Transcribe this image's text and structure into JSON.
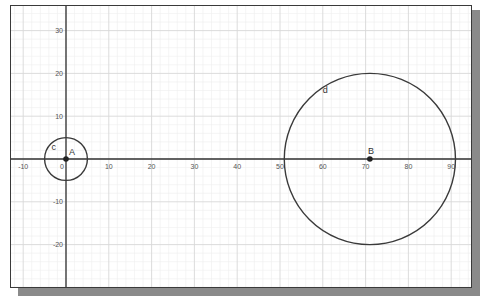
{
  "chart_data": {
    "type": "scatter",
    "title": "",
    "xlabel": "",
    "ylabel": "",
    "xlim": [
      -12,
      94
    ],
    "ylim": [
      -30,
      35
    ],
    "grid": true,
    "x_ticks": [
      -10,
      0,
      10,
      20,
      30,
      40,
      50,
      60,
      70,
      80,
      90
    ],
    "y_ticks": [
      30,
      20,
      10,
      -10,
      -20
    ],
    "x_tick_labels": [
      "-10",
      "0",
      "10",
      "20",
      "30",
      "40",
      "50",
      "60",
      "70",
      "80",
      "90"
    ],
    "y_tick_labels": [
      "30",
      "20",
      "10",
      "-10",
      "-20"
    ],
    "points": [
      {
        "name": "A",
        "x": 0,
        "y": 0
      },
      {
        "name": "B",
        "x": 71,
        "y": 0
      }
    ],
    "circles": [
      {
        "name": "c",
        "center": "A",
        "cx": 0,
        "cy": 0,
        "r": 5
      },
      {
        "name": "d",
        "center": "B",
        "cx": 71,
        "cy": 0,
        "r": 20
      }
    ]
  },
  "labels": {
    "point_a": "A",
    "point_b": "B",
    "circle_c": "c",
    "circle_d": "d",
    "x_ticks": [
      "-10",
      "0",
      "10",
      "20",
      "30",
      "40",
      "50",
      "60",
      "70",
      "80",
      "90"
    ],
    "y_ticks": [
      "30",
      "20",
      "10",
      "-10",
      "-20"
    ]
  },
  "colors": {
    "axis": "#333333",
    "grid_major": "#d8d8d8",
    "grid_minor": "#eeeeee",
    "curve": "#3a3a3a",
    "point": "#222222",
    "shadow": "#8a8a8a"
  }
}
